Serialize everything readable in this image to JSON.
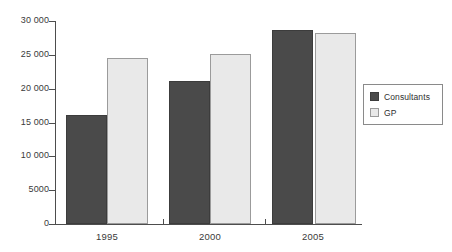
{
  "chart_data": {
    "type": "bar",
    "title": "",
    "subtitle": "",
    "xlabel": "",
    "ylabel": "",
    "categories": [
      "1995",
      "2000",
      "2005"
    ],
    "series": [
      {
        "name": "Consultants",
        "values": [
          16100,
          21100,
          28700
        ],
        "color": "#4a4a4a"
      },
      {
        "name": "GP",
        "values": [
          24600,
          25100,
          28200
        ],
        "color": "#e9e9e9"
      }
    ],
    "ylim": [
      0,
      30000
    ],
    "y_ticks": [
      0,
      5000,
      10000,
      15000,
      20000,
      25000,
      30000
    ],
    "y_tick_labels": [
      "0",
      "5000",
      "10 000",
      "15 000",
      "20 000",
      "25 000",
      "30 000"
    ],
    "grid": false,
    "legend_position": "right",
    "legend_entries": [
      "Consultants",
      "GP"
    ],
    "annotations": []
  },
  "axes": {
    "y_labels": [
      "30 000",
      "25 000",
      "20 000",
      "15 000",
      "10 000",
      "5000",
      "0"
    ],
    "x_labels": [
      "1995",
      "2000",
      "2005"
    ]
  },
  "legend": {
    "items": [
      {
        "label": "Consultants",
        "swatch": "dark-gray-swatch"
      },
      {
        "label": "GP",
        "swatch": "light-gray-swatch"
      }
    ]
  },
  "colors": {
    "consultants": "#4a4a4a",
    "gp": "#e9e9e9",
    "axis": "#4d4d4d",
    "text": "#3a3a3a",
    "background": "#ffffff"
  }
}
